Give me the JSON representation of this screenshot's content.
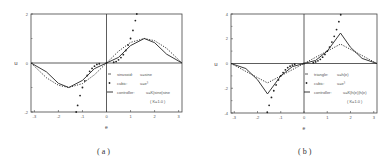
{
  "chart_data": [
    {
      "type": "line",
      "panel": "a",
      "caption": "( a )",
      "xlabel": "e",
      "ylabel": "u",
      "xlim": [
        -3.14,
        3.14
      ],
      "ylim": [
        -2,
        2
      ],
      "xticks": [
        "-3",
        "-2",
        "-1",
        "0",
        "1",
        "2",
        "3"
      ],
      "yticks": [
        "-2",
        "0",
        "2"
      ],
      "grid": false,
      "legend_position": "lower right",
      "legend": [
        {
          "marker": "dash-dot",
          "name": "sinusoid:",
          "formula": "u=sine"
        },
        {
          "marker": "dot",
          "name": "cubic:",
          "formula": "u=e³"
        },
        {
          "marker": "solid",
          "name": "controller:",
          "formula": "u=K|sine|sine"
        },
        {
          "marker": "none",
          "name": "",
          "formula": "( K=1.0 )"
        }
      ],
      "series": [
        {
          "name": "sinusoid u=sin(e)",
          "style": "dotted",
          "x": [
            -3.14,
            -2.5,
            -2,
            -1.57,
            -1,
            -0.5,
            0,
            0.5,
            1,
            1.57,
            2,
            2.5,
            3.14
          ],
          "values": [
            0,
            -0.6,
            -0.91,
            -1,
            -0.84,
            -0.48,
            0,
            0.48,
            0.84,
            1,
            0.91,
            0.6,
            0
          ]
        },
        {
          "name": "cubic u=e^3",
          "style": "markers",
          "x": [
            -1.26,
            -1.2,
            -1.1,
            -1,
            -0.9,
            -0.8,
            -0.7,
            -0.6,
            -0.5,
            -0.4,
            -0.3,
            0,
            0.3,
            0.4,
            0.5,
            0.6,
            0.7,
            0.8,
            0.9,
            1,
            1.1,
            1.2,
            1.26
          ],
          "values": [
            -2,
            -1.73,
            -1.33,
            -1,
            -0.73,
            -0.51,
            -0.34,
            -0.22,
            -0.13,
            -0.06,
            -0.03,
            0,
            0.03,
            0.06,
            0.13,
            0.22,
            0.34,
            0.51,
            0.73,
            1,
            1.33,
            1.73,
            2
          ]
        },
        {
          "name": "controller u=K|sin e|sin e",
          "style": "solid",
          "x": [
            -3.14,
            -2.5,
            -2,
            -1.57,
            -1,
            -0.5,
            0,
            0.5,
            1,
            1.57,
            2,
            2.5,
            3.14
          ],
          "values": [
            0,
            -0.36,
            -0.83,
            -1,
            -0.71,
            -0.23,
            0,
            0.23,
            0.71,
            1,
            0.83,
            0.36,
            0
          ]
        }
      ]
    },
    {
      "type": "line",
      "panel": "b",
      "caption": "( b )",
      "xlabel": "e",
      "ylabel": "u",
      "xlim": [
        -3.14,
        3.14
      ],
      "ylim": [
        -4,
        4
      ],
      "xticks": [
        "-3",
        "-2",
        "-1",
        "0",
        "1",
        "2",
        "3"
      ],
      "yticks": [
        "-4",
        "-2",
        "0",
        "2",
        "4"
      ],
      "grid": false,
      "legend_position": "lower right",
      "legend": [
        {
          "marker": "dash-dot",
          "name": "triangle:",
          "formula": "u=h(e)"
        },
        {
          "marker": "dot",
          "name": "cubic:",
          "formula": "u=e³"
        },
        {
          "marker": "solid",
          "name": "controller:",
          "formula": "u=K|h(e)|h(e)"
        },
        {
          "marker": "none",
          "name": "",
          "formula": "( K=1.0 )"
        }
      ],
      "series": [
        {
          "name": "triangle u=h(e)",
          "style": "dotted",
          "x": [
            -3.14,
            -1.57,
            0,
            1.57,
            3.14
          ],
          "values": [
            0,
            -1.57,
            0,
            1.57,
            0
          ]
        },
        {
          "name": "cubic u=e^3",
          "style": "markers",
          "x": [
            -1.58,
            -1.5,
            -1.4,
            -1.3,
            -1.2,
            -1.1,
            -1,
            -0.9,
            -0.8,
            -0.7,
            -0.6,
            -0.5,
            -0.4,
            0,
            0.4,
            0.5,
            0.6,
            0.7,
            0.8,
            0.9,
            1,
            1.1,
            1.2,
            1.3,
            1.4,
            1.5,
            1.58
          ],
          "values": [
            -3.94,
            -3.38,
            -2.74,
            -2.2,
            -1.73,
            -1.33,
            -1,
            -0.73,
            -0.51,
            -0.34,
            -0.22,
            -0.13,
            -0.06,
            0,
            0.06,
            0.13,
            0.22,
            0.34,
            0.51,
            0.73,
            1,
            1.33,
            1.73,
            2.2,
            2.74,
            3.38,
            3.94
          ]
        },
        {
          "name": "controller u=K|h(e)|h(e)",
          "style": "solid",
          "x": [
            -3.14,
            -2.5,
            -2,
            -1.57,
            -1,
            -0.5,
            0,
            0.5,
            1,
            1.57,
            2,
            2.5,
            3.14
          ],
          "values": [
            0,
            -0.41,
            -1.31,
            -2.46,
            -1,
            -0.25,
            0,
            0.25,
            1,
            2.46,
            1.31,
            0.41,
            0
          ]
        }
      ]
    }
  ]
}
